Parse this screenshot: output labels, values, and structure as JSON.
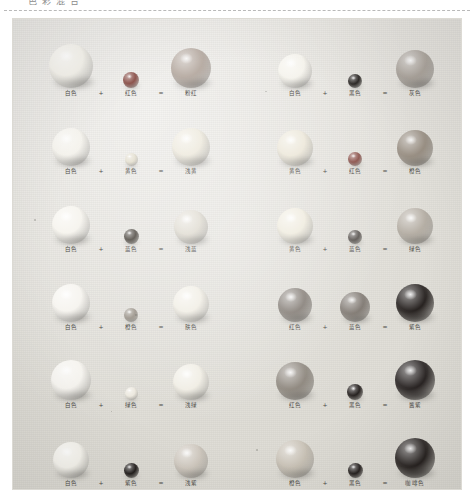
{
  "page": {
    "top_cut_fragment": "色 彩 混 合",
    "photo_caption": ""
  },
  "symbols": {
    "plus": "+",
    "equals": "=",
    "label_suffix_color": "色"
  },
  "palette": {
    "white": "#f3f1ea",
    "red": "#8d5048",
    "black": "#2b2724",
    "pink": "#b9ada4",
    "gray": "#a39c94",
    "yellow": "#ddd6c2",
    "light_yellow": "#e6e1d3",
    "orange": "#b5a795",
    "blue": "#6d6761",
    "light_blue": "#cfc9c0",
    "green": "#9e968c",
    "skin": "#efeade",
    "light_green": "#e4e0d5",
    "purple": "#8b837c",
    "dark_red": "#2e2926",
    "coffee": "#2b2724",
    "cloth": "#e6e4de"
  },
  "chart_data": {
    "type": "table",
    "columns": [
      "颜色A",
      "运算",
      "颜色B",
      "等于",
      "结果颜色"
    ],
    "rows": [
      {
        "left": {
          "a": "白色",
          "b": "红色",
          "result": "粉红"
        },
        "right": {
          "a": "白色",
          "b": "黑色",
          "result": "灰色"
        }
      },
      {
        "left": {
          "a": "白色",
          "b": "黄色",
          "result": "浅黄"
        },
        "right": {
          "a": "黄色",
          "b": "红色",
          "result": "橙色"
        }
      },
      {
        "left": {
          "a": "白色",
          "b": "蓝色",
          "result": "浅蓝"
        },
        "right": {
          "a": "黄色",
          "b": "蓝色",
          "result": "绿色"
        }
      },
      {
        "left": {
          "a": "白色",
          "b": "橙色",
          "result": "肤色"
        },
        "right": {
          "a": "红色",
          "b": "蓝色",
          "result": "紫色"
        }
      },
      {
        "left": {
          "a": "白色",
          "b": "绿色",
          "result": "浅绿"
        },
        "right": {
          "a": "红色",
          "b": "黑色",
          "result": "酱紫"
        }
      },
      {
        "left": {
          "a": "白色",
          "b": "紫色",
          "result": "浅紫"
        },
        "right": {
          "a": "橙色",
          "b": "黑色",
          "result": "咖啡色"
        }
      }
    ]
  },
  "rows": [
    {
      "left": {
        "a": {
          "label": "白色",
          "color": "#f3f1ea",
          "size": 44
        },
        "b": {
          "label": "红色",
          "color": "#8b5049",
          "size": 16
        },
        "result": {
          "label": "粉红",
          "color": "#b5a9a0",
          "size": 40
        }
      },
      "right": {
        "a": {
          "label": "白色",
          "color": "#f5f3ec",
          "size": 34
        },
        "b": {
          "label": "黑色",
          "color": "#2a2623",
          "size": 14
        },
        "result": {
          "label": "灰色",
          "color": "#a9a29a",
          "size": 38
        }
      }
    },
    {
      "left": {
        "a": {
          "label": "白色",
          "color": "#f5f3ed",
          "size": 38
        },
        "b": {
          "label": "黄色",
          "color": "#e4dfd0",
          "size": 13
        },
        "result": {
          "label": "浅黄",
          "color": "#eeeade",
          "size": 38
        }
      },
      "right": {
        "a": {
          "label": "黄色",
          "color": "#ece7d9",
          "size": 36
        },
        "b": {
          "label": "红色",
          "color": "#8a5049",
          "size": 14
        },
        "result": {
          "label": "橙色",
          "color": "#988e82",
          "size": 36
        }
      }
    },
    {
      "left": {
        "a": {
          "label": "白色",
          "color": "#f6f4ee",
          "size": 38
        },
        "b": {
          "label": "蓝色",
          "color": "#555049",
          "size": 15
        },
        "result": {
          "label": "浅蓝",
          "color": "#e0dcd2",
          "size": 34
        }
      },
      "right": {
        "a": {
          "label": "黄色",
          "color": "#efebde",
          "size": 36
        },
        "b": {
          "label": "蓝色",
          "color": "#595450",
          "size": 14
        },
        "result": {
          "label": "绿色",
          "color": "#b5aea4",
          "size": 36
        }
      }
    },
    {
      "left": {
        "a": {
          "label": "白色",
          "color": "#f6f4ef",
          "size": 38
        },
        "b": {
          "label": "橙色",
          "color": "#9d968c",
          "size": 14
        },
        "result": {
          "label": "肤色",
          "color": "#f1eee5",
          "size": 36
        }
      },
      "right": {
        "a": {
          "label": "红色",
          "color": "#847d76",
          "size": 34
        },
        "b": {
          "label": "蓝色",
          "color": "#7d766f",
          "size": 30
        },
        "result": {
          "label": "紫色",
          "color": "#241f1d",
          "size": 38
        }
      }
    },
    {
      "left": {
        "a": {
          "label": "白色",
          "color": "#f6f4ef",
          "size": 40
        },
        "b": {
          "label": "绿色",
          "color": "#ebe7dd",
          "size": 13
        },
        "result": {
          "label": "浅绿",
          "color": "#f0ede4",
          "size": 36
        }
      },
      "right": {
        "a": {
          "label": "红色",
          "color": "#8c857c",
          "size": 38
        },
        "b": {
          "label": "黑色",
          "color": "#241f1d",
          "size": 16
        },
        "result": {
          "label": "酱紫",
          "color": "#262120",
          "size": 40
        }
      }
    },
    {
      "left": {
        "a": {
          "label": "白色",
          "color": "#f4f2eb",
          "size": 36
        },
        "b": {
          "label": "紫色",
          "color": "#1f1b19",
          "size": 15
        },
        "result": {
          "label": "浅紫",
          "color": "#ccc5bb",
          "size": 34
        }
      },
      "right": {
        "a": {
          "label": "橙色",
          "color": "#c7c0b4",
          "size": 38
        },
        "b": {
          "label": "黑色",
          "color": "#231e1c",
          "size": 15
        },
        "result": {
          "label": "咖啡色",
          "color": "#241f1d",
          "size": 40
        }
      }
    }
  ]
}
